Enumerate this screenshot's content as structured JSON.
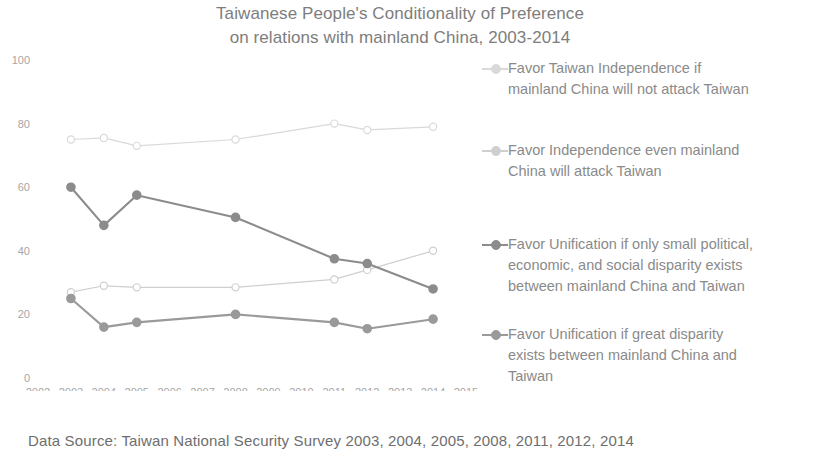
{
  "title": {
    "line1": "Taiwanese People's Conditionality of Preference",
    "line2": "on relations with mainland China, 2003-2014"
  },
  "footer": {
    "text": "Data Source: Taiwan National Security Survey  2003, 2004, 2005, 2008, 2011, 2012, 2014"
  },
  "legend": {
    "items": [
      {
        "label": "Favor Taiwan Independence if\nmainland China will not attack Taiwan",
        "color": "#d9d9d9"
      },
      {
        "label": "Favor Independence even mainland\nChina will attack Taiwan",
        "color": "#cfcfcf"
      },
      {
        "label": "Favor Unification if only small political,\neconomic, and social disparity exists\nbetween mainland China and Taiwan",
        "color": "#8c8c8c"
      },
      {
        "label": "Favor Unification if great disparity\nexists between mainland China and\nTaiwan",
        "color": "#9a9a9a"
      }
    ]
  },
  "chart_data": {
    "type": "line",
    "title": "Taiwanese People's Conditionality of Preference on relations with mainland China, 2003-2014",
    "xlabel": "",
    "ylabel": "",
    "x": [
      2003,
      2004,
      2005,
      2008,
      2011,
      2012,
      2014
    ],
    "xlim": [
      2002,
      2015
    ],
    "ylim": [
      0,
      100
    ],
    "xticks": [
      "2002",
      "2003",
      "2004",
      "2005",
      "2006",
      "2007",
      "2008",
      "2009",
      "2010",
      "2011",
      "2012",
      "2013",
      "2014",
      "2015"
    ],
    "yticks": [
      0,
      20,
      40,
      60,
      80,
      100
    ],
    "grid": false,
    "legend_position": "right",
    "series": [
      {
        "name": "Favor Taiwan Independence if mainland China will not attack Taiwan",
        "color": "#d9d9d9",
        "values": [
          75,
          75.5,
          73,
          75,
          80,
          78,
          79
        ]
      },
      {
        "name": "Favor Independence even mainland China will attack Taiwan",
        "color": "#cfcfcf",
        "values": [
          27,
          29,
          28.5,
          28.5,
          31,
          34,
          40
        ]
      },
      {
        "name": "Favor Unification if only small political, economic, and social disparity exists between mainland China and Taiwan",
        "color": "#8c8c8c",
        "values": [
          60,
          48,
          57.5,
          50.5,
          37.5,
          36,
          28
        ]
      },
      {
        "name": "Favor Unification if great disparity exists between mainland China and Taiwan",
        "color": "#9a9a9a",
        "values": [
          25,
          16,
          17.5,
          20,
          17.5,
          15.5,
          18.5
        ]
      }
    ]
  }
}
